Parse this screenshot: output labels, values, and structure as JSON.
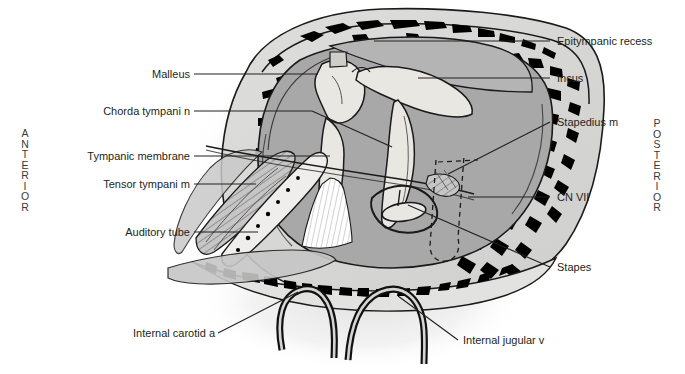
{
  "figure": {
    "orientation": {
      "anterior": "ANTERIOR",
      "posterior": "POSTERIOR"
    },
    "colors": {
      "background": "#ffffff",
      "text": "#231f20",
      "leader_line": "#231f20",
      "bone_black": "#000000",
      "cavity_gray": "#a8a8a8",
      "ossicle_light": "#e8e6e1",
      "outer_tissue": "#d7d7d7",
      "shadow_gray": "#cfcfcf",
      "muscle_gray": "#bcbcbc"
    },
    "labels_left": [
      {
        "id": "malleus",
        "text": "Malleus",
        "x": 190,
        "y": 78,
        "leader": "horizontal"
      },
      {
        "id": "chorda-tympani-n",
        "text": "Chorda tympani n",
        "x": 190,
        "y": 115,
        "leader": "horizontal"
      },
      {
        "id": "tympanic-membrane",
        "text": "Tympanic membrane",
        "x": 190,
        "y": 160,
        "leader": "horizontal"
      },
      {
        "id": "tensor-tympani-m",
        "text": "Tensor tympani m",
        "x": 190,
        "y": 188,
        "leader": "horizontal"
      },
      {
        "id": "auditory-tube",
        "text": "Auditory tube",
        "x": 190,
        "y": 236,
        "leader": "horizontal"
      },
      {
        "id": "internal-carotid-a",
        "text": "Internal carotid a",
        "x": 215,
        "y": 337,
        "leader": "diagonal"
      }
    ],
    "labels_right": [
      {
        "id": "epitympanic-recess",
        "text": "Epitympanic recess",
        "x": 557,
        "y": 45,
        "leader": "horizontal"
      },
      {
        "id": "incus",
        "text": "Incus",
        "x": 557,
        "y": 82,
        "leader": "horizontal"
      },
      {
        "id": "stapedius-m",
        "text": "Stapedius m",
        "x": 557,
        "y": 126,
        "leader": "diagonal"
      },
      {
        "id": "cn-vii",
        "text": "CN VII",
        "x": 557,
        "y": 201,
        "leader": "horizontal"
      },
      {
        "id": "stapes",
        "text": "Stapes",
        "x": 557,
        "y": 271,
        "leader": "diagonal"
      },
      {
        "id": "internal-jugular-v",
        "text": "Internal jugular v",
        "x": 463,
        "y": 344,
        "leader": "diagonal"
      }
    ]
  }
}
